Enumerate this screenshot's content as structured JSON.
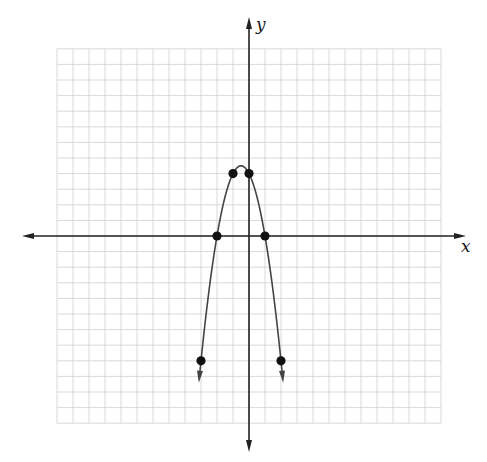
{
  "chart_data": {
    "type": "line",
    "title": "",
    "xlabel": "x",
    "ylabel": "y",
    "function": "y = -2x^2 - 2x + 4",
    "xlim": [
      -12,
      12
    ],
    "ylim": [
      -12,
      12
    ],
    "grid": true,
    "grid_step": 1,
    "curve": {
      "type": "parabola",
      "opens": "down",
      "vertex": [
        -0.5,
        4.5
      ],
      "x_range": [
        -3.1,
        2.1
      ],
      "arrows": "both-ends-down"
    },
    "points": [
      {
        "x": -3,
        "y": -8
      },
      {
        "x": -2,
        "y": 0
      },
      {
        "x": -1,
        "y": 4
      },
      {
        "x": 0,
        "y": 4
      },
      {
        "x": 1,
        "y": 0
      },
      {
        "x": 2,
        "y": -8
      }
    ],
    "legend": null
  },
  "labels": {
    "x_axis": "x",
    "y_axis": "y"
  },
  "colors": {
    "grid": "#cfcfcf",
    "axis": "#222222",
    "curve": "#444444",
    "point": "#111111",
    "background": "#ffffff"
  },
  "layout": {
    "origin_px": [
      249,
      236
    ],
    "unit_px": [
      16.0,
      15.6
    ],
    "grid_extent_px": {
      "left": 57,
      "right": 441,
      "top": 49,
      "bottom": 423
    },
    "x_axis_px": [
      22,
      466
    ],
    "y_axis_px": [
      17,
      452
    ]
  }
}
